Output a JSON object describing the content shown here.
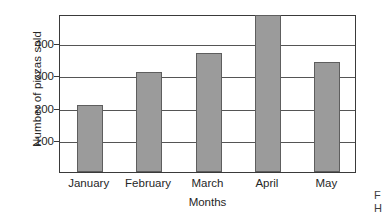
{
  "chart_data": {
    "type": "bar",
    "title": "",
    "xlabel": "Months",
    "ylabel": "Number of pizzas sold",
    "categories": [
      "January",
      "February",
      "March",
      "April",
      "May"
    ],
    "values": [
      208,
      310,
      368,
      487,
      342
    ],
    "ylim": [
      0,
      490
    ],
    "yticks": [
      100,
      200,
      300,
      400
    ],
    "ytick_labels": [
      "100",
      "200",
      "300",
      "400"
    ],
    "grid": "horizontal",
    "legend": "none",
    "bar_color": "#9b9b9b",
    "bar_edge_color": "#5e5e5e",
    "axis_color": "#3a3a3a",
    "background": "#ffffff"
  },
  "margin_note": {
    "line1": "F",
    "line2": "H"
  }
}
